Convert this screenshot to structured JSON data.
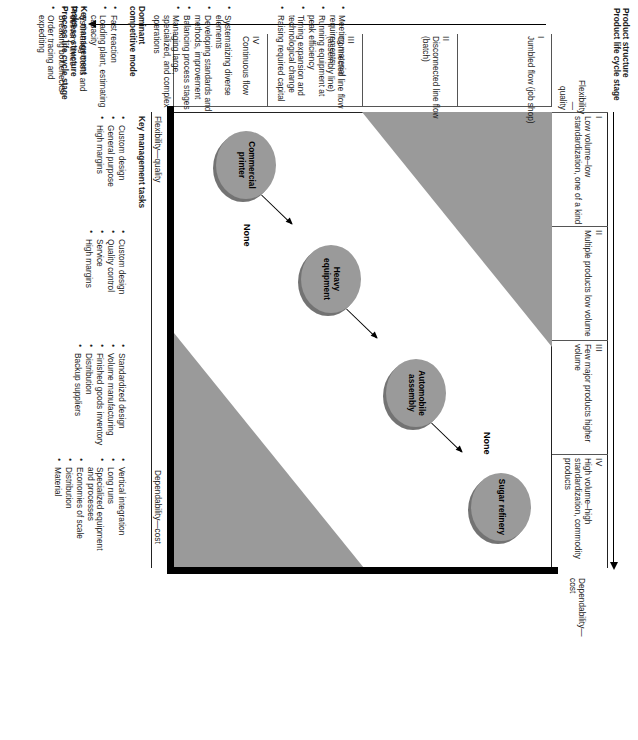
{
  "figure": {
    "type": "product-process matrix",
    "axes": {
      "product_structure_title": "Product structure",
      "product_structure_subtitle": "Product life cycle stage",
      "process_structure_title": "Process structure",
      "process_structure_subtitle": "Process life cycle stage",
      "key_tasks_title": "Key management tasks",
      "dominant_mode_title": "Dominant",
      "dominant_mode_title2": "competitive mode"
    },
    "corner_labels": {
      "top_left": "Flexibility—",
      "top_left2": "quality",
      "top_right": "Dependability—",
      "top_right2": "cost",
      "bottom_left": "Flexibility—quality",
      "bottom_right": "Dependability—cost"
    },
    "product_columns": [
      {
        "numeral": "I",
        "label": "Low volume–low standardization, one of a kind"
      },
      {
        "numeral": "II",
        "label": "Multiple products low volume"
      },
      {
        "numeral": "III",
        "label": "Few major products higher volume"
      },
      {
        "numeral": "IV",
        "label": "High volume–high standardization, commodity products"
      }
    ],
    "process_rows": [
      {
        "numeral": "I",
        "label": "Jumbled flow (job shop)"
      },
      {
        "numeral": "II",
        "label": "Disconnected line flow (batch)"
      },
      {
        "numeral": "III",
        "label": "Connected line flow (assembly line)"
      },
      {
        "numeral": "IV",
        "label": "Continuous flow"
      }
    ],
    "cells": {
      "none_upper_right": "None",
      "none_lower_left": "None",
      "diagonal": [
        {
          "label": "Commercial printer"
        },
        {
          "label": "Heavy equipment"
        },
        {
          "label": "Automobile assembly"
        },
        {
          "label": "Sugar refinery"
        }
      ]
    },
    "key_management_tasks": [
      {
        "items": [
          "Fast reaction",
          "Loading plant, estimating capacity",
          "Estimating costs and delivery times",
          "Breaking bottlenecks",
          "Order tracing and expediting"
        ]
      },
      {
        "items": [
          "Systematizing diverse elements",
          "Developing standards and methods, improvement",
          "Balancing process stages",
          "Managing large, specialized, and complex operations"
        ]
      },
      {
        "items": [
          "Meeting material requirements",
          "Running equipment at peak efficiency",
          "Timing expansion and technological change",
          "Raising required capital"
        ]
      }
    ],
    "dominant_competitive_mode": [
      {
        "items": [
          "Custom design",
          "General purpose",
          "High margins"
        ]
      },
      {
        "items": [
          "Custom design",
          "Quality control",
          "Service",
          "High margins"
        ]
      },
      {
        "items": [
          "Standardized design",
          "Volume manufacturing",
          "Finished goods inventory",
          "Distribution",
          "Backup suppliers"
        ]
      },
      {
        "items": [
          "Vertical integration",
          "Long runs",
          "Specialized equipment and processes",
          "Economies of scale",
          "Distribution",
          "Material"
        ]
      }
    ],
    "colors": {
      "fill_grey": "#9a9a9a",
      "rule": "#222222",
      "text": "#1a1a1a"
    }
  }
}
